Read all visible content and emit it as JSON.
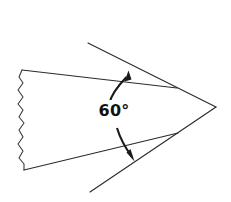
{
  "figure": {
    "background_color": "#ffffff",
    "line_color": "#2b2b2b",
    "label_color": "#111111",
    "width": 231,
    "height": 202
  },
  "annotation": {
    "angle_value": "60",
    "degree_symbol": "°",
    "angle_label": "60°",
    "label_x": 114,
    "label_y": 114
  },
  "geometry": {
    "top_edge": "M22,70 L177,88",
    "bottom_edge": "M24,170 L178,133",
    "upper_extension": "M88,43 L216,107",
    "lower_extension": "M90,192 L216,107",
    "break_line": "M22,70 L19,77 L23,83 L18,90 L23,97 L18,104 L23,110 L19,117 L24,123 L19,130 L23,137 L18,144 L23,151 L19,158 L24,164 L24,170",
    "arc_path": "M127,75 C109,95 109,130 130,155",
    "upper_arrow_tip": [
      128,
      72
    ],
    "lower_arrow_tip": [
      133,
      159
    ],
    "right_vertex": [
      216,
      107
    ]
  },
  "elements": {
    "wedge_name": "wedge-body",
    "break_name": "break-line",
    "arc_name": "angle-arc",
    "label_name": "angle-label"
  }
}
